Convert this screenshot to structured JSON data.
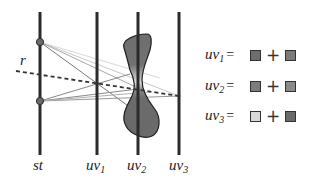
{
  "diagram": {
    "planes": [
      {
        "id": "st",
        "label_main": "st",
        "label_sub": "",
        "x": 40
      },
      {
        "id": "uv1",
        "label_main": "uv",
        "label_sub": "1",
        "x": 97
      },
      {
        "id": "uv2",
        "label_main": "uv",
        "label_sub": "2",
        "x": 138
      },
      {
        "id": "uv3",
        "label_main": "uv",
        "label_sub": "3",
        "x": 179
      }
    ],
    "ray_label": "r",
    "colors": {
      "plane_line": "#2b2b2b",
      "object_fill": "#6e6e6e",
      "object_highlight": "#d8d8d8",
      "ray_dashed": "#333333",
      "node": "#666666",
      "light_ray": "#9a9a9a"
    }
  },
  "legend": {
    "rows": [
      {
        "label_main": "uv",
        "label_sub": "1",
        "equals": "=",
        "plus": "+",
        "swatch_a": "#6d6d6d",
        "swatch_b": "#7a7a7a"
      },
      {
        "label_main": "uv",
        "label_sub": "2",
        "equals": "=",
        "plus": "+",
        "swatch_a": "#7c7c7c",
        "swatch_b": "#8a8a8a"
      },
      {
        "label_main": "uv",
        "label_sub": "3",
        "equals": "=",
        "plus": "+",
        "swatch_a": "#d9d9d9",
        "swatch_b": "#6a6a6a"
      }
    ]
  }
}
